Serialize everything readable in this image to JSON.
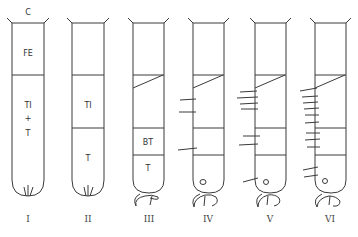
{
  "figure": {
    "top_label": "C",
    "tubes": [
      {
        "numeral": "I",
        "zones": [
          "FE",
          "TI",
          "+",
          "T"
        ]
      },
      {
        "numeral": "II",
        "zones": [
          "TI",
          "T"
        ]
      },
      {
        "numeral": "III",
        "zones": [
          "BT",
          "T"
        ]
      },
      {
        "numeral": "IV",
        "zones": []
      },
      {
        "numeral": "V",
        "zones": []
      },
      {
        "numeral": "VI",
        "zones": []
      }
    ]
  }
}
